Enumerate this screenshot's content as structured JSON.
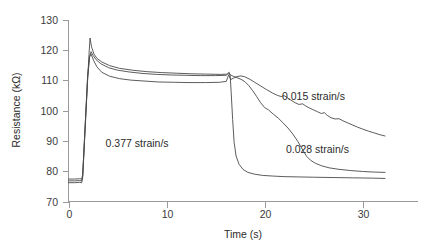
{
  "chart_data": {
    "type": "line",
    "title": "",
    "xlabel": "Time (s)",
    "ylabel": "Resistance (kΩ)",
    "xlim": [
      0,
      34
    ],
    "ylim": [
      70,
      130
    ],
    "xticks": [
      0,
      10,
      20,
      30
    ],
    "xticklabels": [
      "0",
      "10",
      "20",
      "30"
    ],
    "yticks": [
      70,
      80,
      90,
      100,
      110,
      120,
      130
    ],
    "yticklabels": [
      "70",
      "80",
      "90",
      "100",
      "110",
      "120",
      "130"
    ],
    "grid": false,
    "legend_position": "inline-annotations",
    "line_color": "#4a4a4a",
    "axis_color": "#9a9a9a",
    "annotations": [
      {
        "text": "0.377 strain/s",
        "x": 7.0,
        "y": 88.0
      },
      {
        "text": "0.015 strain/s",
        "x": 25.0,
        "y": 103.5
      },
      {
        "text": "0.028 strain/s",
        "x": 25.4,
        "y": 86.0
      }
    ],
    "series": [
      {
        "name": "0.377 strain/s",
        "points": [
          [
            0.0,
            76.2
          ],
          [
            0.6,
            76.2
          ],
          [
            1.15,
            76.3
          ],
          [
            1.35,
            76.2
          ],
          [
            1.45,
            78.0
          ],
          [
            1.7,
            94.0
          ],
          [
            1.95,
            110.0
          ],
          [
            2.1,
            119.0
          ],
          [
            2.2,
            123.9
          ],
          [
            2.35,
            121.0
          ],
          [
            2.6,
            118.6
          ],
          [
            2.9,
            117.2
          ],
          [
            3.4,
            116.0
          ],
          [
            4.2,
            114.8
          ],
          [
            5.2,
            113.9
          ],
          [
            6.5,
            113.3
          ],
          [
            8.0,
            112.8
          ],
          [
            9.5,
            112.5
          ],
          [
            11.0,
            112.3
          ],
          [
            12.5,
            112.1
          ],
          [
            14.0,
            112.0
          ],
          [
            15.5,
            111.9
          ],
          [
            16.2,
            112.0
          ],
          [
            16.4,
            112.6
          ],
          [
            16.5,
            111.4
          ],
          [
            16.6,
            106.0
          ],
          [
            16.75,
            97.0
          ],
          [
            16.9,
            89.5
          ],
          [
            17.1,
            85.0
          ],
          [
            17.4,
            82.3
          ],
          [
            17.8,
            80.6
          ],
          [
            18.3,
            79.6
          ],
          [
            19.0,
            79.0
          ],
          [
            19.8,
            78.6
          ],
          [
            20.8,
            78.4
          ],
          [
            22.0,
            78.2
          ],
          [
            23.5,
            78.1
          ],
          [
            25.0,
            78.0
          ],
          [
            27.0,
            77.9
          ],
          [
            29.0,
            77.8
          ],
          [
            31.0,
            77.7
          ],
          [
            32.3,
            77.6
          ]
        ]
      },
      {
        "name": "0.028 strain/s",
        "points": [
          [
            0.0,
            77.4
          ],
          [
            0.6,
            77.4
          ],
          [
            1.15,
            77.5
          ],
          [
            1.35,
            77.4
          ],
          [
            1.45,
            79.0
          ],
          [
            1.7,
            95.0
          ],
          [
            1.95,
            110.5
          ],
          [
            2.15,
            117.5
          ],
          [
            2.3,
            119.4
          ],
          [
            2.5,
            118.2
          ],
          [
            2.8,
            116.8
          ],
          [
            3.3,
            115.4
          ],
          [
            4.1,
            114.1
          ],
          [
            5.0,
            113.3
          ],
          [
            6.2,
            112.7
          ],
          [
            7.6,
            112.2
          ],
          [
            9.0,
            111.9
          ],
          [
            10.5,
            111.7
          ],
          [
            12.0,
            111.6
          ],
          [
            13.5,
            111.5
          ],
          [
            15.0,
            111.5
          ],
          [
            16.1,
            111.6
          ],
          [
            16.35,
            112.4
          ],
          [
            16.5,
            111.8
          ],
          [
            16.8,
            111.3
          ],
          [
            17.2,
            110.8
          ],
          [
            17.6,
            110.3
          ],
          [
            18.0,
            109.5
          ],
          [
            18.4,
            108.2
          ],
          [
            18.8,
            106.5
          ],
          [
            19.2,
            104.6
          ],
          [
            19.6,
            102.6
          ],
          [
            20.0,
            101.0
          ],
          [
            20.4,
            100.2
          ],
          [
            20.9,
            98.8
          ],
          [
            21.4,
            97.5
          ],
          [
            21.9,
            95.9
          ],
          [
            22.4,
            94.2
          ],
          [
            22.9,
            92.2
          ],
          [
            23.4,
            89.8
          ],
          [
            23.9,
            87.0
          ],
          [
            24.3,
            84.9
          ],
          [
            24.7,
            83.6
          ],
          [
            25.2,
            82.6
          ],
          [
            25.8,
            81.8
          ],
          [
            26.6,
            81.1
          ],
          [
            27.6,
            80.6
          ],
          [
            28.8,
            80.2
          ],
          [
            30.0,
            79.9
          ],
          [
            31.2,
            79.7
          ],
          [
            32.3,
            79.6
          ]
        ]
      },
      {
        "name": "0.015 strain/s",
        "points": [
          [
            0.0,
            76.8
          ],
          [
            0.6,
            76.8
          ],
          [
            1.15,
            76.9
          ],
          [
            1.35,
            76.8
          ],
          [
            1.45,
            78.5
          ],
          [
            1.7,
            95.0
          ],
          [
            1.95,
            111.5
          ],
          [
            2.15,
            117.8
          ],
          [
            2.3,
            118.6
          ],
          [
            2.55,
            116.6
          ],
          [
            2.9,
            114.4
          ],
          [
            3.4,
            112.6
          ],
          [
            4.2,
            111.3
          ],
          [
            5.2,
            110.5
          ],
          [
            6.4,
            110.0
          ],
          [
            7.8,
            109.7
          ],
          [
            9.2,
            109.4
          ],
          [
            10.8,
            109.3
          ],
          [
            12.4,
            109.2
          ],
          [
            14.0,
            109.2
          ],
          [
            15.4,
            109.3
          ],
          [
            16.1,
            109.6
          ],
          [
            16.35,
            111.8
          ],
          [
            16.55,
            110.2
          ],
          [
            16.8,
            110.6
          ],
          [
            17.2,
            111.2
          ],
          [
            17.6,
            111.4
          ],
          [
            18.0,
            111.1
          ],
          [
            18.5,
            110.3
          ],
          [
            19.0,
            109.3
          ],
          [
            19.6,
            108.1
          ],
          [
            20.2,
            106.9
          ],
          [
            20.8,
            105.8
          ],
          [
            21.3,
            105.0
          ],
          [
            21.7,
            104.6
          ],
          [
            22.0,
            104.9
          ],
          [
            22.3,
            104.3
          ],
          [
            22.7,
            103.4
          ],
          [
            23.1,
            102.6
          ],
          [
            23.5,
            102.0
          ],
          [
            23.9,
            102.2
          ],
          [
            24.2,
            101.5
          ],
          [
            24.6,
            100.8
          ],
          [
            25.0,
            100.2
          ],
          [
            25.4,
            99.6
          ],
          [
            25.8,
            99.0
          ],
          [
            26.1,
            99.3
          ],
          [
            26.4,
            98.4
          ],
          [
            26.8,
            97.6
          ],
          [
            27.2,
            97.2
          ],
          [
            27.6,
            97.3
          ],
          [
            28.0,
            96.6
          ],
          [
            28.5,
            95.9
          ],
          [
            29.0,
            95.2
          ],
          [
            29.5,
            94.5
          ],
          [
            30.0,
            93.9
          ],
          [
            30.6,
            93.2
          ],
          [
            31.2,
            92.6
          ],
          [
            31.8,
            92.0
          ],
          [
            32.3,
            91.6
          ]
        ]
      }
    ]
  },
  "axes": {
    "y_label": "Resistance (kΩ)",
    "x_label": "Time (s)"
  }
}
